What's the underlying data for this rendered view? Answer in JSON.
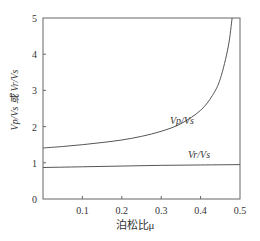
{
  "chart_data": {
    "type": "line",
    "title": "",
    "xlabel": "泊松比μ",
    "ylabel": "Vp/Vs 或 Vr/Vs",
    "xlim": [
      0,
      0.5
    ],
    "ylim": [
      0,
      5
    ],
    "x_ticks": [
      "0.1",
      "0.2",
      "0.3",
      "0.4",
      "0.5"
    ],
    "y_ticks": [
      "0",
      "1",
      "2",
      "3",
      "4",
      "5"
    ],
    "grid": false,
    "series": [
      {
        "name": "Vp/Vs",
        "x": [
          0,
          0.05,
          0.1,
          0.15,
          0.2,
          0.25,
          0.3,
          0.35,
          0.4,
          0.43,
          0.45,
          0.47,
          0.48
        ],
        "values": [
          1.41,
          1.45,
          1.5,
          1.56,
          1.63,
          1.73,
          1.87,
          2.08,
          2.45,
          2.86,
          3.32,
          4.2,
          5.0
        ]
      },
      {
        "name": "Vr/Vs",
        "x": [
          0,
          0.1,
          0.2,
          0.3,
          0.4,
          0.5
        ],
        "values": [
          0.87,
          0.89,
          0.91,
          0.93,
          0.94,
          0.95
        ]
      }
    ],
    "annotations": [
      {
        "text": "Vp/Vs",
        "x": 0.31,
        "y": 2.2
      },
      {
        "text": "Vr/Vs",
        "x": 0.4,
        "y": 1.3
      }
    ]
  },
  "labels": {
    "xlabel": "泊松比μ",
    "ylabel": "Vp/Vs 或 Vr/Vs",
    "vp": "Vp/Vs",
    "vr": "Vr/Vs"
  }
}
